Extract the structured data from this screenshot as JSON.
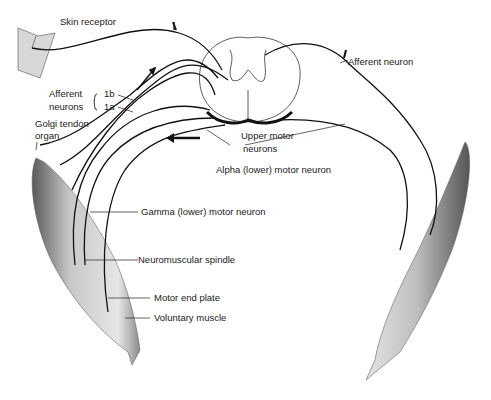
{
  "diagram": {
    "labels": {
      "skin_receptor": "Skin receptor",
      "afferent_neurons": "Afferent",
      "afferent_neurons_2": "neurons",
      "fiber_1b": "1b",
      "fiber_1a": "1a",
      "golgi_tendon": "Golgi tendon",
      "golgi_organ": "organ",
      "afferent_neuron": "Afferent neuron",
      "upper_motor": "Upper motor",
      "upper_motor_2": "neurons",
      "alpha_motor": "Alpha (lower) motor neuron",
      "gamma_motor": "Gamma (lower) motor neuron",
      "spindle": "Neuromuscular spindle",
      "end_plate": "Motor end plate",
      "voluntary_muscle": "Voluntary muscle"
    },
    "colors": {
      "ink": "#111111",
      "muscle_fill": "#c9c9c9",
      "skin_fill": "#d8d8d8"
    }
  }
}
